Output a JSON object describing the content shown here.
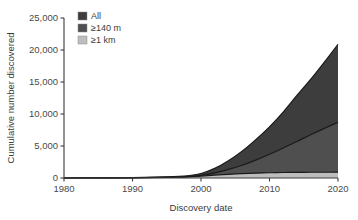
{
  "chart_data": {
    "type": "area",
    "title": "",
    "subtitle": "",
    "xlabel": "Discovery date",
    "ylabel": "Cumulative number discovered",
    "xlim": [
      1980,
      2020
    ],
    "ylim": [
      0,
      25000
    ],
    "grid": false,
    "legend_position": "top-left",
    "x_ticks": [
      1980,
      1990,
      2000,
      2010,
      2020
    ],
    "x_tick_labels": [
      "1980",
      "1990",
      "2000",
      "2010",
      "2020"
    ],
    "y_ticks": [
      0,
      5000,
      10000,
      15000,
      20000,
      25000
    ],
    "y_tick_labels": [
      "0",
      "5,000",
      "10,000",
      "15,000",
      "20,000",
      "25,000"
    ],
    "x": [
      1980,
      1985,
      1990,
      1995,
      1998,
      2000,
      2002,
      2004,
      2006,
      2008,
      2010,
      2012,
      2014,
      2016,
      2018,
      2020
    ],
    "series": [
      {
        "name": "All",
        "label": "All",
        "color": "#3d3d3d",
        "values": [
          0,
          20,
          60,
          180,
          350,
          700,
          1500,
          2700,
          4200,
          6000,
          8000,
          10300,
          12900,
          15400,
          18100,
          20900
        ]
      },
      {
        "name": "≥140 m",
        "label": "≥140 m",
        "color": "#4f4f4f",
        "values": [
          0,
          15,
          40,
          120,
          220,
          420,
          800,
          1350,
          2000,
          2800,
          3700,
          4700,
          5700,
          6750,
          7750,
          8700
        ]
      },
      {
        "name": "≥1 km",
        "label": "≥1 km",
        "color": "#bdbdbd",
        "values": [
          0,
          10,
          30,
          90,
          160,
          300,
          450,
          580,
          680,
          760,
          820,
          860,
          880,
          895,
          900,
          905
        ]
      }
    ]
  },
  "legend": {
    "entries": [
      {
        "label": "All",
        "color": "#3d3d3d"
      },
      {
        "label": "≥140 m",
        "color": "#4f4f4f"
      },
      {
        "label": "≥1 km",
        "color": "#bdbdbd"
      }
    ]
  },
  "axes": {
    "x_title": "Discovery date",
    "y_title": "Cumulative number discovered"
  }
}
